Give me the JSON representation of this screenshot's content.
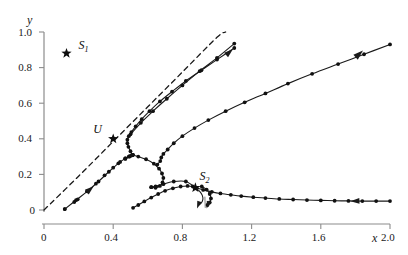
{
  "figure": {
    "background": "#ffffff",
    "width": 408,
    "height": 255,
    "line_color": "#1a1a1a",
    "axis_color": "#8c8c8c",
    "marker_color": "#111111"
  },
  "axes": {
    "x_name": "x",
    "y_name": "y",
    "x_ticks": [
      "0",
      "0.4",
      "0.8",
      "1.2",
      "1.6",
      "2.0"
    ],
    "x_tick_values": [
      0,
      0.4,
      0.8,
      1.2,
      1.6,
      2.0
    ],
    "y_ticks": [
      "0",
      "0.2",
      "0.4",
      "0.6",
      "0.8",
      "1.0"
    ],
    "y_tick_values": [
      0,
      0.2,
      0.4,
      0.6,
      0.8,
      1.0
    ],
    "xlim": [
      0,
      2.0
    ],
    "ylim": [
      0,
      1.0
    ],
    "grid": false
  },
  "annotations": [
    {
      "name": "S1",
      "label": "S",
      "subscript": "1",
      "x": 0.13,
      "y": 0.88,
      "label_dx": 12,
      "label_dy": -14
    },
    {
      "name": "U",
      "label": "U",
      "subscript": "",
      "x": 0.4,
      "y": 0.4,
      "label_dx": -20,
      "label_dy": -16
    },
    {
      "name": "S2",
      "label": "S",
      "subscript": "2",
      "x": 0.875,
      "y": 0.125,
      "label_dx": 4,
      "label_dy": -18
    }
  ],
  "chart_data": {
    "type": "line",
    "title": "",
    "xlabel": "x",
    "ylabel": "y",
    "xlim": [
      0,
      2.0
    ],
    "ylim": [
      0,
      1.0
    ],
    "grid": false,
    "legend_position": "none",
    "annotations": [
      {
        "label": "S_1",
        "x": 0.13,
        "y": 0.88,
        "marker": "star"
      },
      {
        "label": "U",
        "x": 0.4,
        "y": 0.4,
        "marker": "star"
      },
      {
        "label": "S_2",
        "x": 0.875,
        "y": 0.125,
        "marker": "star"
      }
    ],
    "series": [
      {
        "name": "asymptote-dashed",
        "style": "dashed",
        "markers": false,
        "x": [
          0.0,
          0.2,
          0.4,
          0.6,
          0.8,
          1.0,
          1.05
        ],
        "y": [
          0.0,
          0.19,
          0.385,
          0.58,
          0.775,
          0.97,
          1.0
        ]
      },
      {
        "name": "upper-left-branch",
        "style": "solid",
        "markers": true,
        "x": [
          0.12,
          0.185,
          0.25,
          0.315,
          0.375,
          0.43,
          0.47,
          0.495,
          0.51,
          0.515,
          0.51,
          0.495,
          0.47
        ],
        "y": [
          0.005,
          0.055,
          0.105,
          0.16,
          0.215,
          0.262,
          0.29,
          0.303,
          0.308,
          0.31,
          0.308,
          0.3,
          0.287
        ]
      },
      {
        "name": "upper-left-branch-markers",
        "style": "none",
        "markers": true,
        "x": [
          0.12,
          0.175,
          0.195,
          0.25,
          0.3,
          0.35,
          0.4,
          0.44,
          0.47,
          0.49,
          0.505,
          0.512
        ],
        "y": [
          0.005,
          0.045,
          0.06,
          0.105,
          0.148,
          0.195,
          0.238,
          0.27,
          0.29,
          0.3,
          0.306,
          0.309
        ]
      },
      {
        "name": "fold-upper-return",
        "style": "solid",
        "markers": true,
        "x": [
          0.512,
          0.5,
          0.488,
          0.482,
          0.482,
          0.49,
          0.505,
          0.53,
          0.565,
          0.61,
          0.67,
          0.74,
          0.82,
          0.91,
          1.0,
          1.1
        ],
        "y": [
          0.309,
          0.33,
          0.355,
          0.375,
          0.395,
          0.415,
          0.438,
          0.47,
          0.51,
          0.555,
          0.61,
          0.665,
          0.725,
          0.785,
          0.845,
          0.91
        ]
      },
      {
        "name": "upper-ascending-tail",
        "style": "solid",
        "markers": true,
        "x": [
          0.5,
          0.56,
          0.63,
          0.71,
          0.8,
          0.9,
          1.0,
          1.1
        ],
        "y": [
          0.425,
          0.49,
          0.555,
          0.625,
          0.7,
          0.78,
          0.855,
          0.935
        ]
      },
      {
        "name": "middle-descending-branch",
        "style": "solid",
        "markers": true,
        "x": [
          0.51,
          0.545,
          0.59,
          0.635,
          0.665,
          0.682,
          0.69,
          0.685,
          0.67,
          0.645,
          0.62,
          0.62,
          0.645,
          0.69,
          0.75,
          0.82,
          0.875
        ],
        "y": [
          0.31,
          0.3,
          0.285,
          0.26,
          0.232,
          0.205,
          0.18,
          0.155,
          0.135,
          0.125,
          0.128,
          0.128,
          0.133,
          0.145,
          0.16,
          0.16,
          0.125
        ]
      },
      {
        "name": "right-ascending-branch",
        "style": "solid",
        "markers": true,
        "x": [
          0.655,
          0.672,
          0.678,
          0.69,
          0.715,
          0.75,
          0.8,
          0.87,
          0.95,
          1.05,
          1.16,
          1.28,
          1.41,
          1.55,
          1.7,
          1.85,
          2.0
        ],
        "y": [
          0.255,
          0.275,
          0.295,
          0.315,
          0.34,
          0.375,
          0.415,
          0.46,
          0.505,
          0.555,
          0.605,
          0.655,
          0.71,
          0.765,
          0.82,
          0.875,
          0.93
        ]
      },
      {
        "name": "lower-hump-branch",
        "style": "solid",
        "markers": true,
        "x": [
          0.515,
          0.545,
          0.58,
          0.62,
          0.66,
          0.7,
          0.745,
          0.79,
          0.83,
          0.86,
          0.875
        ],
        "y": [
          0.012,
          0.028,
          0.048,
          0.07,
          0.09,
          0.108,
          0.122,
          0.132,
          0.135,
          0.132,
          0.125
        ]
      },
      {
        "name": "lower-flat-tail",
        "style": "solid",
        "markers": true,
        "x": [
          0.875,
          0.92,
          0.97,
          1.02,
          1.08,
          1.14,
          1.21,
          1.28,
          1.36,
          1.44,
          1.52,
          1.6,
          1.68,
          1.76,
          1.84,
          1.92,
          2.0
        ],
        "y": [
          0.125,
          0.113,
          0.102,
          0.093,
          0.085,
          0.078,
          0.072,
          0.067,
          0.062,
          0.059,
          0.056,
          0.054,
          0.052,
          0.051,
          0.05,
          0.05,
          0.05
        ]
      },
      {
        "name": "hook-inner",
        "style": "solid",
        "markers": false,
        "x": [
          0.875,
          0.9,
          0.915,
          0.918,
          0.908,
          0.893
        ],
        "y": [
          0.125,
          0.105,
          0.082,
          0.058,
          0.038,
          0.028
        ]
      },
      {
        "name": "hook-outer",
        "style": "solid",
        "markers": true,
        "x": [
          0.912,
          0.94,
          0.958,
          0.965,
          0.958,
          0.945
        ],
        "y": [
          0.132,
          0.115,
          0.09,
          0.065,
          0.042,
          0.028
        ]
      }
    ]
  }
}
